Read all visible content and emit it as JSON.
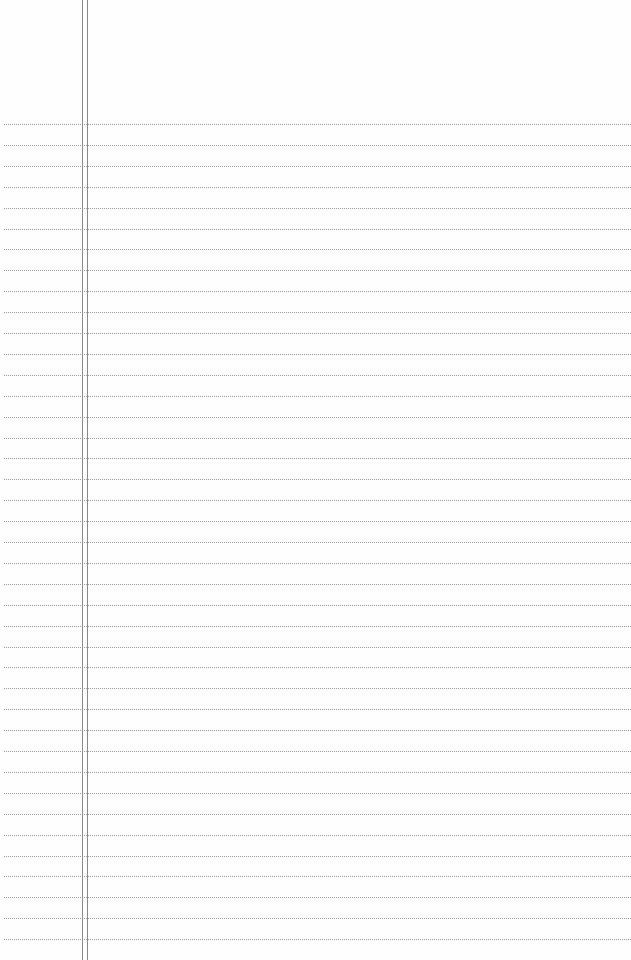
{
  "paper": {
    "background": "#fefefe",
    "rule_color": "#9a9a9a",
    "margin_color": "#8a8a8a",
    "rule_start_y": 124,
    "rule_spacing": 20.9,
    "rule_count": 40,
    "margin_lines_x": [
      82,
      87
    ]
  }
}
